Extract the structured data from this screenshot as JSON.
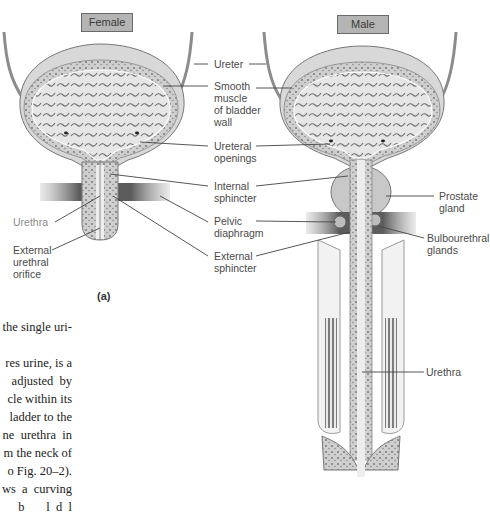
{
  "figure": {
    "panel_letter": "(a)",
    "female": {
      "tag": "Female",
      "labels": {
        "urethra": "Urethra",
        "external_urethral_orifice": "External\nurethral\norifice"
      }
    },
    "male": {
      "tag": "Male",
      "labels": {
        "prostate_gland": "Prostate\ngland",
        "bulbourethral_glands": "Bulbourethral\nglands",
        "urethra": "Urethra"
      }
    },
    "shared_labels": {
      "ureter": "Ureter",
      "smooth_muscle": "Smooth\nmuscle\nof bladder\nwall",
      "ureteral_openings": "Ureteral\nopenings",
      "internal_sphincter": "Internal\nsphincter",
      "pelvic_diaphragm": "Pelvic\ndiaphragm",
      "external_sphincter": "External\nsphincter"
    }
  },
  "body_text": {
    "lines": [
      "the single uri-",
      "",
      "res urine, is a",
      "adjusted  by",
      "cle within its",
      "ladder to the",
      "ne  urethra  in",
      "m the neck of",
      "o Fig. 20–2).",
      "ws  a  curving",
      "b       l  d  l"
    ]
  }
}
